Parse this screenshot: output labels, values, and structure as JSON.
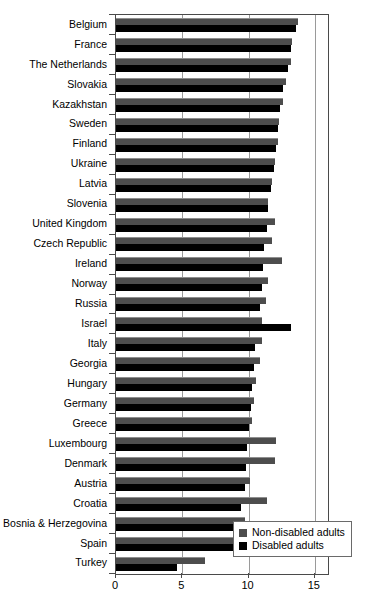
{
  "chart_data": {
    "type": "bar",
    "orientation": "horizontal",
    "title": "",
    "subtitle": "",
    "xlabel": "",
    "ylabel": "",
    "xlim": [
      0,
      16
    ],
    "xticks": [
      0,
      5,
      10,
      15
    ],
    "xticklabels": [
      "0",
      "5",
      "10",
      "15"
    ],
    "grid": true,
    "grid_axis": "x",
    "legend_position": "bottom-right",
    "categories": [
      "Belgium",
      "France",
      "The Netherlands",
      "Slovakia",
      "Kazakhstan",
      "Sweden",
      "Finland",
      "Ukraine",
      "Latvia",
      "Slovenia",
      "United Kingdom",
      "Czech Republic",
      "Ireland",
      "Norway",
      "Russia",
      "Israel",
      "Italy",
      "Georgia",
      "Hungary",
      "Germany",
      "Greece",
      "Luxembourg",
      "Denmark",
      "Austria",
      "Croatia",
      "Bosnia & Herzegovina",
      "Spain",
      "Turkey"
    ],
    "series": [
      {
        "name": "Non-disabled adults",
        "color": "#4d4d4d",
        "values": [
          13.7,
          13.3,
          13.2,
          12.8,
          12.6,
          12.3,
          12.2,
          12.0,
          11.8,
          11.5,
          12.0,
          11.8,
          12.5,
          11.5,
          11.3,
          11.0,
          11.0,
          10.9,
          10.6,
          10.4,
          10.3,
          12.1,
          12.0,
          10.1,
          11.4,
          9.7,
          9.0,
          6.7
        ]
      },
      {
        "name": "Disabled adults",
        "color": "#000000",
        "values": [
          13.6,
          13.2,
          13.0,
          12.6,
          12.4,
          12.2,
          12.1,
          11.9,
          11.7,
          11.5,
          11.4,
          11.2,
          11.1,
          11.0,
          10.9,
          13.2,
          10.5,
          10.4,
          10.3,
          10.2,
          10.0,
          9.9,
          9.8,
          9.7,
          9.4,
          9.4,
          9.1,
          4.6
        ]
      }
    ]
  },
  "legend": {
    "items": [
      {
        "label": "Non-disabled adults",
        "swatch": "nd"
      },
      {
        "label": "Disabled adults",
        "swatch": "d"
      }
    ]
  }
}
